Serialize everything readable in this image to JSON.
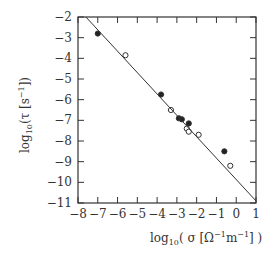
{
  "chart_data": {
    "type": "scatter",
    "title": "",
    "xlabel": "log10( σ [Ω^-1 m^-1] )",
    "ylabel": "log10( τ [s^-1] )",
    "xlim": [
      -8,
      1
    ],
    "ylim": [
      -11,
      -2
    ],
    "x_ticks": [
      -8,
      -7,
      -6,
      -5,
      -4,
      -3,
      -2,
      -1,
      0,
      1
    ],
    "y_ticks": [
      -2,
      -3,
      -4,
      -5,
      -6,
      -7,
      -8,
      -9,
      -10,
      -11
    ],
    "grid": false,
    "legend": null,
    "series": [
      {
        "name": "filled",
        "marker": "filled-circle",
        "points": [
          [
            -7.0,
            -2.8
          ],
          [
            -3.8,
            -5.75
          ],
          [
            -2.9,
            -6.9
          ],
          [
            -2.75,
            -6.95
          ],
          [
            -2.4,
            -7.15
          ],
          [
            -0.6,
            -8.5
          ]
        ]
      },
      {
        "name": "open",
        "marker": "open-circle",
        "points": [
          [
            -5.6,
            -3.85
          ],
          [
            -3.3,
            -6.5
          ],
          [
            -2.5,
            -7.4
          ],
          [
            -2.4,
            -7.55
          ],
          [
            -1.9,
            -7.7
          ],
          [
            -0.3,
            -9.2
          ]
        ]
      },
      {
        "name": "fit-line",
        "type": "line",
        "points": [
          [
            -7.6,
            -2.0
          ],
          [
            1.0,
            -10.9
          ]
        ]
      }
    ]
  },
  "labels": {
    "x_prefix": "log",
    "x_sub": "10",
    "x_rest": "( σ [Ω",
    "x_sup1": "−1",
    "x_m": "m",
    "x_sup2": "−1",
    "x_close": "] )",
    "y_prefix": "log",
    "y_sub": "10",
    "y_rest": "(τ [s",
    "y_sup": "−1",
    "y_close": "])"
  }
}
